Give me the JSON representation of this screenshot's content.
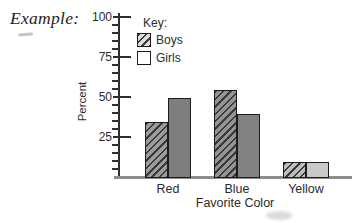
{
  "page": {
    "example_label": "Example:"
  },
  "key": {
    "title": "Key:",
    "items": [
      {
        "label": "Boys",
        "swatch": "hatched"
      },
      {
        "label": "Girls",
        "swatch": "empty"
      }
    ]
  },
  "chart_data": {
    "type": "bar",
    "title": "",
    "categories": [
      "Red",
      "Blue",
      "Yellow"
    ],
    "series": [
      {
        "name": "Boys",
        "values": [
          35,
          55,
          10
        ],
        "style": "hatched",
        "fill_colors": [
          "#9c9c9c",
          "#949494",
          "#bdbdbd"
        ]
      },
      {
        "name": "Girls",
        "values": [
          50,
          40,
          10
        ],
        "style": "solid",
        "fill_colors": [
          "#7e7e7e",
          "#828282",
          "#c9c9c9"
        ]
      }
    ],
    "xlabel": "Favorite Color",
    "ylabel": "Percent",
    "ylim": [
      0,
      100
    ],
    "yticks": [
      25,
      50,
      75,
      100
    ],
    "minor_tick_step": 5,
    "grid": false,
    "legend_position": "top-left-inside"
  },
  "colors": {
    "axis": "#2e2e2e",
    "baseline": "#8e8e8e",
    "bar_border": "#1c1c1c",
    "hatch_line": "#3a3a3a",
    "key_hatch_bg": "#dcdcdc",
    "text": "#2b2b2b"
  }
}
